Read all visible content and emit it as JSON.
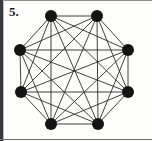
{
  "panel": {
    "width": 152,
    "height": 141,
    "background_color": "#fdfdfc",
    "border_color": "#3a3a3e"
  },
  "label": {
    "number": "5.",
    "color": "#1b1b1b"
  },
  "chart_data": {
    "type": "diagram",
    "diagram_type": "graph",
    "title": "5.",
    "graph_name": "complete graph K8",
    "vertex_count": 8,
    "edge_count": 28,
    "is_complete": true,
    "layout": "regular octagon",
    "center": [
      74,
      70
    ],
    "radius": 56,
    "vertex_color": "#141414",
    "vertex_radius": 6,
    "edge_color": "#2b2b2b",
    "edge_width": 0.9,
    "vertices": [
      {
        "id": 0,
        "label": "v1",
        "x": 51,
        "y": 16
      },
      {
        "id": 1,
        "label": "v2",
        "x": 97,
        "y": 16
      },
      {
        "id": 2,
        "label": "v3",
        "x": 128,
        "y": 50
      },
      {
        "id": 3,
        "label": "v4",
        "x": 128,
        "y": 92
      },
      {
        "id": 4,
        "label": "v5",
        "x": 98,
        "y": 124
      },
      {
        "id": 5,
        "label": "v6",
        "x": 51,
        "y": 124
      },
      {
        "id": 6,
        "label": "v7",
        "x": 21,
        "y": 92
      },
      {
        "id": 7,
        "label": "v8",
        "x": 20,
        "y": 50
      }
    ],
    "edges": [
      [
        0,
        1
      ],
      [
        0,
        2
      ],
      [
        0,
        3
      ],
      [
        0,
        4
      ],
      [
        0,
        5
      ],
      [
        0,
        6
      ],
      [
        0,
        7
      ],
      [
        1,
        2
      ],
      [
        1,
        3
      ],
      [
        1,
        4
      ],
      [
        1,
        5
      ],
      [
        1,
        6
      ],
      [
        1,
        7
      ],
      [
        2,
        3
      ],
      [
        2,
        4
      ],
      [
        2,
        5
      ],
      [
        2,
        6
      ],
      [
        2,
        7
      ],
      [
        3,
        4
      ],
      [
        3,
        5
      ],
      [
        3,
        6
      ],
      [
        3,
        7
      ],
      [
        4,
        5
      ],
      [
        4,
        6
      ],
      [
        4,
        7
      ],
      [
        5,
        6
      ],
      [
        5,
        7
      ],
      [
        6,
        7
      ]
    ]
  }
}
